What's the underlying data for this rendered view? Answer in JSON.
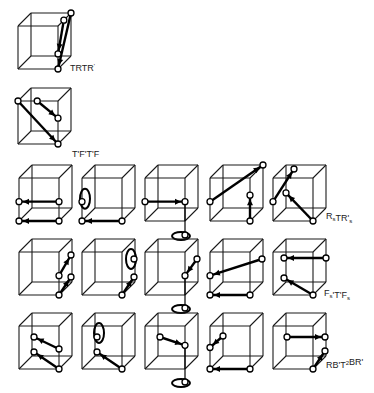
{
  "diagram": {
    "colors": {
      "line": "#000000",
      "background": "#ffffff",
      "node_fill": "#ffffff"
    },
    "sequences": [
      {
        "id": "seq1",
        "label_parts": [
          {
            "t": "TRTR"
          },
          {
            "t": "'",
            "sup": true
          }
        ],
        "label_text": "TRTR'"
      },
      {
        "id": "seq2",
        "label_parts": [
          {
            "t": "T'F'T'F"
          }
        ],
        "label_text": "T'F'T'F"
      },
      {
        "id": "seq3",
        "label_parts": [
          {
            "t": "R"
          },
          {
            "t": "s",
            "sub": true
          },
          {
            "t": "TR'"
          },
          {
            "t": "s",
            "sub": true
          }
        ],
        "label_text": "RsTR's"
      },
      {
        "id": "seq4",
        "label_parts": [
          {
            "t": "F"
          },
          {
            "t": "s",
            "sub": true
          },
          {
            "t": "'T'F"
          },
          {
            "t": "s",
            "sub": true
          }
        ],
        "label_text": "Fs'T'Fs"
      },
      {
        "id": "seq5",
        "label_parts": [
          {
            "t": "RB'T"
          },
          {
            "t": "2",
            "sup": true
          },
          {
            "t": "BR'"
          }
        ],
        "label_text": "RB'T2BR'"
      }
    ],
    "rows": [
      {
        "row": 1,
        "sequence": "seq1",
        "cube_count": 1
      },
      {
        "row": 2,
        "sequence": "seq2",
        "cube_count": 1
      },
      {
        "row": 3,
        "sequence": "seq3",
        "cube_count": 5
      },
      {
        "row": 4,
        "sequence": "seq4",
        "cube_count": 5
      },
      {
        "row": 5,
        "sequence": "seq5",
        "cube_count": 5
      }
    ]
  }
}
